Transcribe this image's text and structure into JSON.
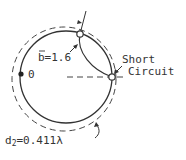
{
  "diagram": {
    "type": "smith-chart-stub-matching",
    "labels": {
      "susceptance": "b=1.6",
      "short_line1": "Short",
      "short_line2": "Circuit",
      "origin": "0",
      "distance_prefix": "d",
      "distance_sub": "2",
      "distance_value": "=0.411λ"
    },
    "colors": {
      "stroke": "#333333",
      "background": "#ffffff"
    }
  }
}
